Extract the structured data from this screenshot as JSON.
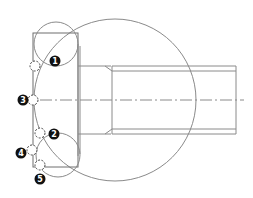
{
  "diagram": {
    "title": "",
    "colors": {
      "line": "#8a8a8a",
      "badge": "#111111",
      "badge_text": "#ffffff"
    },
    "markers": [
      {
        "label": "1",
        "x": 35,
        "y": 66,
        "badge_x": 50,
        "badge_y": 61
      },
      {
        "label": "2",
        "x": 34,
        "y": 133,
        "badge_x": 48,
        "badge_y": 134
      },
      {
        "label": "3",
        "x": 34,
        "y": 100,
        "badge_x": 21,
        "badge_y": 100
      },
      {
        "label": "4",
        "x": 32,
        "y": 150,
        "badge_x": 18,
        "badge_y": 155
      },
      {
        "label": "5",
        "x": 33,
        "y": 165,
        "badge_x": 31,
        "badge_y": 179
      }
    ]
  }
}
